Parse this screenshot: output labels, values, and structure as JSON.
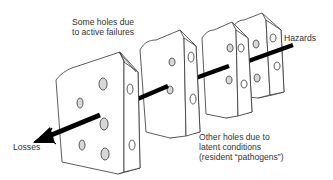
{
  "diagram": {
    "labels": {
      "active_failures": [
        "Some holes due",
        "to active failures"
      ],
      "hazards": "Hazards",
      "losses": "Losses",
      "latent_conditions": [
        "Other holes due to",
        "latent conditions",
        "(resident “pathogens”)"
      ]
    },
    "slices": [
      {
        "name": "defense-layer-1",
        "position": "front"
      },
      {
        "name": "defense-layer-2",
        "position": "second"
      },
      {
        "name": "defense-layer-3",
        "position": "third"
      },
      {
        "name": "defense-layer-4",
        "position": "back"
      }
    ],
    "arrow": {
      "from": "Hazards",
      "to": "Losses",
      "direction": "top-right to bottom-left"
    },
    "colors": {
      "stroke": "#333333",
      "fill": "#ffffff",
      "hole_shade": "#d8d8d8",
      "arrow": "#000000",
      "text": "#333333"
    }
  }
}
